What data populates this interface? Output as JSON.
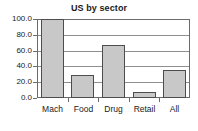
{
  "chart_data": {
    "type": "bar",
    "title": "US by sector",
    "xlabel": "",
    "ylabel": "",
    "categories": [
      "Mach",
      "Food",
      "Drug",
      "Retail",
      "All"
    ],
    "values": [
      100.0,
      29.0,
      67.0,
      7.5,
      35.5
    ],
    "ylim": [
      0.0,
      100.0
    ],
    "ytick_labels": [
      "100.0",
      "80.0",
      "60.0",
      "40.0",
      "20.0",
      "0.0"
    ],
    "ytick_values": [
      100.0,
      80.0,
      60.0,
      40.0,
      20.0,
      0.0
    ],
    "grid": true,
    "legend": "none",
    "bar_fill_color": "#c8c8c8",
    "bar_border_color": "#4d4d4d",
    "grid_color": "#8f8f8f",
    "axis_color": "#6b6b6b",
    "plot_background": "#ffffff"
  }
}
